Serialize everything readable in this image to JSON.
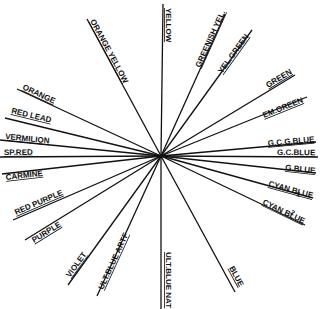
{
  "diagram": {
    "type": "radial-color-wheel",
    "center": [
      161,
      156
    ],
    "line_color": "#111111",
    "background": "#ffffff",
    "spokes": [
      {
        "id": "yellow",
        "label": "YELLOW",
        "end": [
          163,
          4
        ],
        "label_pos": [
          166,
          8
        ],
        "angle": 90
      },
      {
        "id": "greenish-yel",
        "label": "GREENISH YEL.",
        "end": [
          225,
          14
        ],
        "label_pos": [
          200,
          68
        ],
        "angle": -66
      },
      {
        "id": "yel-green",
        "label": "YEL.GREEN",
        "end": [
          252,
          30
        ],
        "label_pos": [
          222,
          74
        ],
        "angle": -56
      },
      {
        "id": "green",
        "label": "GREEN",
        "end": [
          295,
          75
        ],
        "label_pos": [
          268,
          88
        ],
        "angle": -29
      },
      {
        "id": "em-green",
        "label": "EM.GREEN",
        "end": [
          307,
          97
        ],
        "label_pos": [
          264,
          118
        ],
        "angle": -22
      },
      {
        "id": "gcg-blue",
        "label": "G.C.G.BLUE",
        "end": [
          316,
          142
        ],
        "label_pos": [
          268,
          146
        ],
        "angle": -5
      },
      {
        "id": "gc-blue",
        "label": "G.C.BLUE",
        "end": [
          318,
          157
        ],
        "label_pos": [
          277,
          155
        ],
        "angle": 0
      },
      {
        "id": "g-blue",
        "label": "G.BLUE",
        "end": [
          316,
          173
        ],
        "label_pos": [
          285,
          170
        ],
        "angle": 5
      },
      {
        "id": "cyan-blue-1",
        "label": "CYAN BLUE",
        "sub": "1",
        "end": [
          313,
          198
        ],
        "label_pos": [
          268,
          186
        ],
        "angle": 13
      },
      {
        "id": "cyan-blue-2",
        "label": "CYAN BLUE",
        "sub": "2",
        "end": [
          305,
          225
        ],
        "label_pos": [
          262,
          204
        ],
        "angle": 19
      },
      {
        "id": "blue",
        "label": "BLUE",
        "end": [
          235,
          292
        ],
        "label_pos": [
          229,
          268
        ],
        "angle": 61
      },
      {
        "id": "ult-blue-nat",
        "label": "ULT.BLUE NAT",
        "end": [
          161,
          309
        ],
        "label_pos": [
          166,
          252
        ],
        "angle": 90
      },
      {
        "id": "ult-blue-artf",
        "label": "ULT.BLUE ARTF",
        "end": [
          97,
          296
        ],
        "label_pos": [
          103,
          290
        ],
        "angle": -64
      },
      {
        "id": "violet",
        "label": "VIOLET",
        "end": [
          68,
          285
        ],
        "label_pos": [
          70,
          278
        ],
        "angle": -56
      },
      {
        "id": "purple",
        "label": "PURPLE",
        "end": [
          25,
          240
        ],
        "label_pos": [
          34,
          243
        ],
        "angle": -30
      },
      {
        "id": "red-purple",
        "label": "RED PURPLE",
        "end": [
          13,
          220
        ],
        "label_pos": [
          16,
          215
        ],
        "angle": -22
      },
      {
        "id": "carmine",
        "label": "CARMINE",
        "end": [
          2,
          174
        ],
        "label_pos": [
          6,
          180
        ],
        "angle": 7
      },
      {
        "id": "sp-red",
        "label": "SP.RED",
        "end": [
          0,
          157
        ],
        "label_pos": [
          4,
          155
        ],
        "angle": 0
      },
      {
        "id": "vermilion",
        "label": "VERMILION",
        "end": [
          0,
          140
        ],
        "label_pos": [
          5,
          139
        ],
        "angle": 4
      },
      {
        "id": "red-lead",
        "label": "RED LEAD",
        "end": [
          5,
          118
        ],
        "label_pos": [
          11,
          113
        ],
        "angle": 10
      },
      {
        "id": "orange",
        "label": "ORANGE",
        "end": [
          17,
          89
        ],
        "label_pos": [
          22,
          89
        ],
        "angle": 19
      },
      {
        "id": "orange-yellow",
        "label": "ORANGE YELLOW",
        "end": [
          87,
          19
        ],
        "label_pos": [
          90,
          21
        ],
        "angle": 58
      }
    ]
  }
}
